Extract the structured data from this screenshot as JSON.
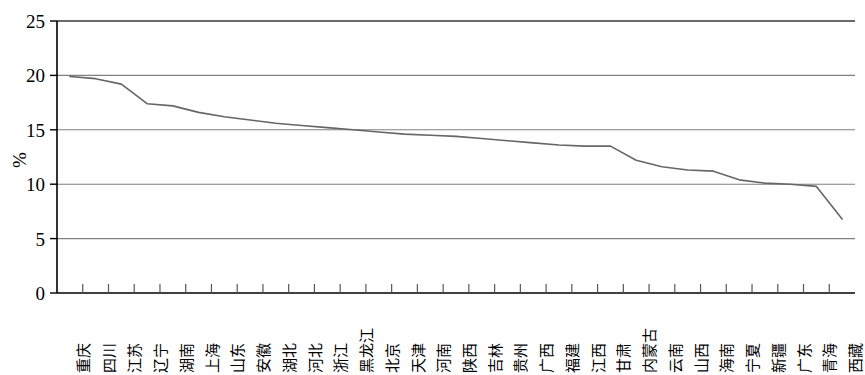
{
  "chart_data": {
    "type": "line",
    "title": "",
    "subtitle": "",
    "xlabel": "",
    "ylabel": "%",
    "ylim": [
      0,
      25
    ],
    "yticks": [
      0,
      5,
      10,
      15,
      20,
      25
    ],
    "ytick_labels": [
      "0",
      "5",
      "10",
      "15",
      "20",
      "25"
    ],
    "grid": true,
    "grid_axis": "y",
    "legend": false,
    "legend_position": "none",
    "line_color": "#666666",
    "axis_color": "#000000",
    "grid_color": "#808080",
    "background": "#ffffff",
    "categories": [
      "重庆",
      "四川",
      "江苏",
      "辽宁",
      "湖南",
      "上海",
      "山东",
      "安徽",
      "湖北",
      "河北",
      "浙江",
      "黑龙江",
      "北京",
      "天津",
      "河南",
      "陕西",
      "吉林",
      "贵州",
      "广西",
      "福建",
      "江西",
      "甘肃",
      "内蒙古",
      "云南",
      "山西",
      "海南",
      "宁夏",
      "新疆",
      "广东",
      "青海",
      "西藏"
    ],
    "values": [
      19.9,
      19.7,
      19.2,
      17.4,
      17.2,
      16.6,
      16.2,
      15.9,
      15.6,
      15.4,
      15.2,
      15.0,
      14.8,
      14.6,
      14.5,
      14.4,
      14.2,
      14.0,
      13.8,
      13.6,
      13.5,
      13.5,
      12.2,
      11.6,
      11.3,
      11.2,
      10.4,
      10.1,
      10.0,
      9.8,
      6.8
    ],
    "series": [
      {
        "name": "%",
        "values": [
          19.9,
          19.7,
          19.2,
          17.4,
          17.2,
          16.6,
          16.2,
          15.9,
          15.6,
          15.4,
          15.2,
          15.0,
          14.8,
          14.6,
          14.5,
          14.4,
          14.2,
          14.0,
          13.8,
          13.6,
          13.5,
          13.5,
          12.2,
          11.6,
          11.3,
          11.2,
          10.4,
          10.1,
          10.0,
          9.8,
          6.8
        ]
      }
    ]
  }
}
